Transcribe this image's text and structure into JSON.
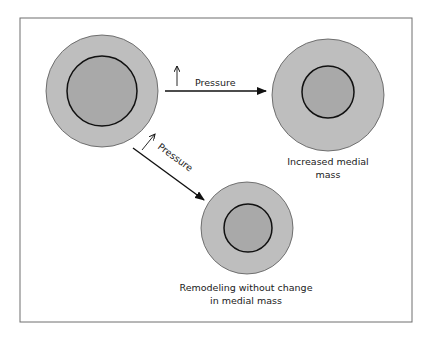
{
  "diagram": {
    "type": "vascular remodeling schematic",
    "colors": {
      "background": "#ffffff",
      "frame": "#6e6e6e",
      "outer_fill": "#bebebe",
      "inner_fill": "#a9a9a9",
      "stroke": "#1a1a1a",
      "outer_stroke": "#555555"
    },
    "vessels": [
      {
        "id": "original",
        "cx": 102,
        "cy": 91,
        "outer_r": 56,
        "inner_r": 35,
        "caption": []
      },
      {
        "id": "increased-medial-mass",
        "cx": 328,
        "cy": 95,
        "outer_r": 56,
        "inner_r": 26,
        "caption": [
          "Increased medial",
          "mass"
        ]
      },
      {
        "id": "remodeling",
        "cx": 247,
        "cy": 228,
        "outer_r": 46,
        "inner_r": 24,
        "caption": [
          "Remodeling without change",
          "in medial mass"
        ]
      }
    ],
    "arrows": [
      {
        "id": "to-increased-mass",
        "label": "Pressure",
        "indicator": "↑"
      },
      {
        "id": "to-remodeling",
        "label": "Pressure",
        "indicator": "↑"
      }
    ]
  }
}
